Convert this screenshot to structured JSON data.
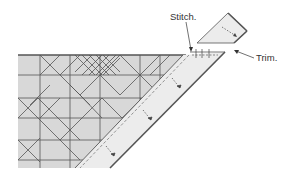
{
  "diagram": {
    "type": "quilting-instruction",
    "labels": {
      "stitch": "Stitch.",
      "trim": "Trim."
    },
    "colors": {
      "background": "#ffffff",
      "fabric_fill": "#d9d9d9",
      "strip_fill": "#ececec",
      "line": "#444444",
      "heavy_edge": "#555555"
    },
    "elements": [
      {
        "name": "pieced-triangle",
        "description": "gray pieced block pattern with diamonds and squares in a triangular area"
      },
      {
        "name": "border-strip",
        "description": "light strip sewn along the diagonal edge with dashed stitch line and arrow marks"
      },
      {
        "name": "trimmed-corner",
        "description": "small detached trapezoid piece in upper right after trimming"
      },
      {
        "name": "stitch-callout",
        "description": "arrow pointing to stitch point at corner"
      },
      {
        "name": "trim-callout",
        "description": "arrow pointing to trim edge"
      }
    ]
  }
}
